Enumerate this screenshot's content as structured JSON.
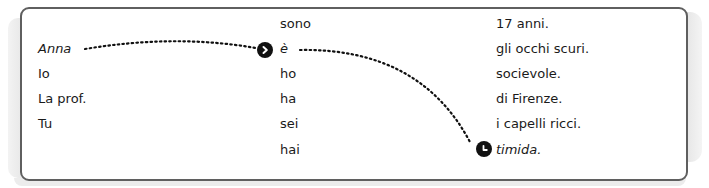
{
  "exercise": {
    "subjects": [
      "Anna",
      "Io",
      "La prof.",
      "Tu"
    ],
    "verbs": [
      "sono",
      "è",
      "ho",
      "ha",
      "sei",
      "hai"
    ],
    "complements": [
      "17 anni.",
      "gli occhi scuri.",
      "socievole.",
      "di Firenze.",
      "i capelli ricci.",
      "timida."
    ],
    "example_links": [
      {
        "from": "Anna",
        "to": "è",
        "marker": "chevron-right-icon"
      },
      {
        "from": "è",
        "to": "timida.",
        "marker": "clock-icon"
      }
    ]
  },
  "colors": {
    "border": "#5f5f5f",
    "text": "#1a1a1a",
    "marker": "#111111"
  }
}
